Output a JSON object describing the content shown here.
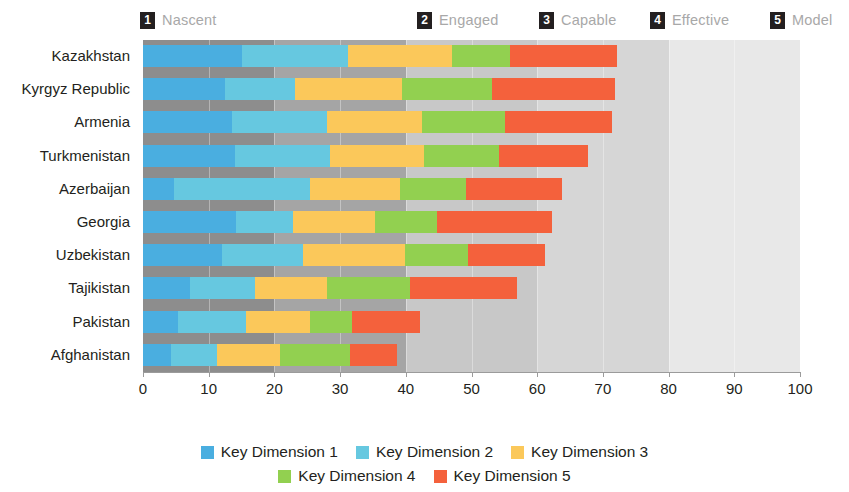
{
  "maturity_levels": [
    {
      "num": "1",
      "label": "Nascent",
      "left_px": 140,
      "range": [
        0,
        20
      ]
    },
    {
      "num": "2",
      "label": "Engaged",
      "left_px": 417,
      "range": [
        20,
        40
      ]
    },
    {
      "num": "3",
      "label": "Capable",
      "left_px": 539,
      "range": [
        40,
        60
      ]
    },
    {
      "num": "4",
      "label": "Effective",
      "left_px": 650,
      "range": [
        60,
        80
      ]
    },
    {
      "num": "5",
      "label": "Model",
      "left_px": 770,
      "range": [
        80,
        100
      ]
    }
  ],
  "series_legend": {
    "row1": [
      {
        "label": "Key Dimension 1",
        "color": "#4aaee0"
      },
      {
        "label": "Key Dimension 2",
        "color": "#66c8e0"
      },
      {
        "label": "Key Dimension 3",
        "color": "#fcc council"
      }
    ]
  },
  "colors": {
    "kd1": "#4aaee0",
    "kd2": "#66c8e0",
    "kd3": "#fbc85a",
    "kd4": "#92d050",
    "kd5": "#f4613c",
    "band1": "#8d8d8d",
    "band2": "#a5a5a5",
    "band3": "#c8c8c8",
    "band4": "#d6d6d6",
    "band5": "#e8e8e8",
    "axis": "#9b9b9b",
    "text": "#231f20",
    "level_text": "#a8a8a8"
  },
  "chart_data": {
    "type": "bar",
    "orientation": "horizontal",
    "stacked": true,
    "title": "",
    "xlabel": "",
    "ylabel": "",
    "xlim": [
      0,
      100
    ],
    "xticks": [
      0,
      10,
      20,
      30,
      40,
      50,
      60,
      70,
      80,
      90,
      100
    ],
    "grid": false,
    "legend_position": "bottom",
    "categories": [
      "Kazakhstan",
      "Kyrgyz Republic",
      "Armenia",
      "Turkmenistan",
      "Azerbaijan",
      "Georgia",
      "Uzbekistan",
      "Tajikistan",
      "Pakistan",
      "Afghanistan"
    ],
    "series": [
      {
        "name": "Key Dimension 1",
        "color": "#4aaee0",
        "values": [
          15.0,
          12.5,
          13.5,
          14.0,
          4.7,
          14.2,
          12.0,
          7.2,
          5.3,
          4.3
        ]
      },
      {
        "name": "Key Dimension 2",
        "color": "#66c8e0",
        "values": [
          16.2,
          10.6,
          14.5,
          14.5,
          20.7,
          8.6,
          12.3,
          9.8,
          10.4,
          7.0
        ]
      },
      {
        "name": "Key Dimension 3",
        "color": "#fbc85a",
        "values": [
          15.8,
          16.3,
          14.5,
          14.3,
          13.7,
          12.5,
          15.6,
          11.0,
          9.7,
          9.5
        ]
      },
      {
        "name": "Key Dimension 4",
        "color": "#92d050",
        "values": [
          8.8,
          13.7,
          12.6,
          11.4,
          10.1,
          9.4,
          9.6,
          12.6,
          6.4,
          10.7
        ]
      },
      {
        "name": "Key Dimension 5",
        "color": "#f4613c",
        "values": [
          16.3,
          18.7,
          16.3,
          13.5,
          14.6,
          17.6,
          11.7,
          16.3,
          10.4,
          7.2
        ]
      }
    ],
    "totals": [
      72.1,
      71.8,
      71.4,
      67.7,
      63.8,
      62.3,
      61.2,
      56.9,
      42.2,
      38.7
    ]
  },
  "legend": {
    "items": [
      {
        "label": "Key Dimension 1",
        "color": "#4aaee0"
      },
      {
        "label": "Key Dimension 2",
        "color": "#66c8e0"
      },
      {
        "label": "Key Dimension 3",
        "color": "#fbc85a"
      },
      {
        "label": "Key Dimension 4",
        "color": "#92d050"
      },
      {
        "label": "Key Dimension 5",
        "color": "#f4613c"
      }
    ]
  },
  "axis": {
    "tick_labels": [
      "0",
      "10",
      "20",
      "30",
      "40",
      "50",
      "60",
      "70",
      "80",
      "90",
      "100"
    ]
  }
}
